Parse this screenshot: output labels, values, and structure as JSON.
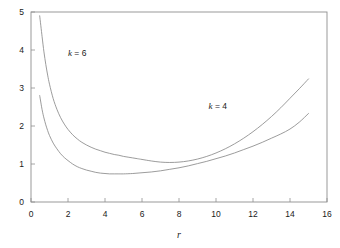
{
  "chart_data": {
    "type": "line",
    "title": "",
    "subtitle": "",
    "xlabel": "r",
    "ylabel": "",
    "xlim": [
      0,
      16
    ],
    "ylim": [
      0,
      5
    ],
    "grid": false,
    "legend_position": "inline-annotation",
    "xticks": [
      "0",
      "2",
      "4",
      "6",
      "8",
      "10",
      "12",
      "14",
      "16"
    ],
    "xtick_values": [
      0,
      2,
      4,
      6,
      8,
      10,
      12,
      14,
      16
    ],
    "yticks": [
      "0",
      "1",
      "2",
      "3",
      "4",
      "5"
    ],
    "ytick_values": [
      0,
      1,
      2,
      3,
      4,
      5
    ],
    "annotations": [
      {
        "text_italic": "k",
        "text_rest": " = 6",
        "x": 2.0,
        "y": 3.85
      },
      {
        "text_italic": "k",
        "text_rest": " = 4",
        "x": 9.6,
        "y": 2.45
      }
    ],
    "series": [
      {
        "name": "k = 6",
        "color": "#8a8a8a",
        "x": [
          0.47,
          0.6,
          0.7,
          0.8,
          0.9,
          1.0,
          1.2,
          1.4,
          1.6,
          1.8,
          2.0,
          2.25,
          2.5,
          2.75,
          3.0,
          3.25,
          3.5,
          3.75,
          4.0,
          4.25,
          4.5,
          4.75,
          5.0,
          5.25,
          5.5,
          5.75,
          6.0,
          6.5,
          7.0,
          7.5,
          8.0,
          8.5,
          9.0,
          9.5,
          10.0,
          10.5,
          11.0,
          11.5,
          12.0,
          12.5,
          13.0,
          13.5,
          14.0,
          14.5,
          15.0
        ],
        "y": [
          4.9,
          4.35,
          3.95,
          3.62,
          3.34,
          3.1,
          2.72,
          2.44,
          2.22,
          2.05,
          1.91,
          1.77,
          1.66,
          1.57,
          1.5,
          1.44,
          1.39,
          1.35,
          1.31,
          1.28,
          1.25,
          1.23,
          1.2,
          1.18,
          1.16,
          1.14,
          1.12,
          1.08,
          1.05,
          1.04,
          1.05,
          1.08,
          1.13,
          1.2,
          1.29,
          1.4,
          1.53,
          1.68,
          1.85,
          2.04,
          2.25,
          2.48,
          2.73,
          2.98,
          3.24
        ],
        "minimum": {
          "x": 7.4,
          "y": 1.04
        },
        "endpoint": {
          "x": 15.0,
          "y": 3.24
        }
      },
      {
        "name": "k = 4",
        "color": "#8a8a8a",
        "x": [
          0.47,
          0.6,
          0.7,
          0.8,
          0.9,
          1.0,
          1.2,
          1.4,
          1.6,
          1.8,
          2.0,
          2.25,
          2.5,
          2.75,
          3.0,
          3.25,
          3.5,
          3.75,
          4.0,
          4.25,
          4.5,
          4.75,
          5.0,
          5.5,
          6.0,
          6.5,
          7.0,
          7.5,
          8.0,
          8.5,
          9.0,
          9.5,
          10.0,
          10.5,
          11.0,
          11.5,
          12.0,
          12.5,
          13.0,
          13.5,
          14.0,
          14.5,
          15.0
        ],
        "y": [
          2.8,
          2.43,
          2.21,
          2.03,
          1.88,
          1.75,
          1.55,
          1.4,
          1.27,
          1.17,
          1.09,
          1.0,
          0.93,
          0.88,
          0.84,
          0.81,
          0.78,
          0.76,
          0.75,
          0.74,
          0.74,
          0.74,
          0.74,
          0.75,
          0.77,
          0.79,
          0.82,
          0.86,
          0.9,
          0.95,
          1.01,
          1.07,
          1.14,
          1.21,
          1.29,
          1.38,
          1.47,
          1.57,
          1.68,
          1.79,
          1.92,
          2.1,
          2.33
        ],
        "minimum": {
          "x": 4.4,
          "y": 0.735
        },
        "endpoint": {
          "x": 15.0,
          "y": 2.33
        }
      }
    ],
    "crossing_point": {
      "x": 5.4,
      "y": 0.79
    }
  },
  "colors": {
    "background": "#ffffff",
    "axis": "#8f8f8f",
    "curve": "#8a8a8a",
    "text": "#1a1a1a"
  }
}
